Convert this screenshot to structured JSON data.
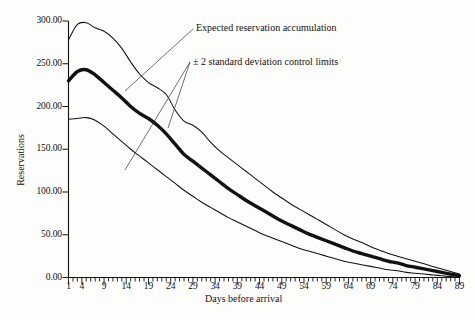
{
  "chart_data": {
    "type": "line",
    "title": "",
    "xlabel": "Days before arrival",
    "ylabel": "Reservations",
    "xlim": [
      1,
      89
    ],
    "ylim": [
      0,
      300
    ],
    "grid": false,
    "legend_position": "none",
    "x_tick_labels": [
      "1",
      "4",
      "9",
      "14",
      "19",
      "24",
      "29",
      "34",
      "39",
      "44",
      "49",
      "54",
      "59",
      "64",
      "69",
      "74",
      "79",
      "84",
      "89"
    ],
    "x_tick_values": [
      1,
      4,
      9,
      14,
      19,
      24,
      29,
      34,
      39,
      44,
      49,
      54,
      59,
      64,
      69,
      74,
      79,
      84,
      89
    ],
    "y_tick_labels": [
      "0.00",
      "50.00",
      "100.00",
      "150.00",
      "200.00",
      "250.00",
      "300.00"
    ],
    "y_tick_values": [
      0,
      50,
      100,
      150,
      200,
      250,
      300
    ],
    "x": [
      1,
      3,
      5,
      7,
      9,
      11,
      13,
      15,
      17,
      19,
      21,
      23,
      25,
      27,
      29,
      31,
      33,
      35,
      37,
      39,
      41,
      43,
      45,
      47,
      49,
      51,
      53,
      55,
      57,
      59,
      61,
      63,
      65,
      67,
      69,
      71,
      73,
      75,
      77,
      79,
      81,
      83,
      85,
      87,
      89
    ],
    "series": [
      {
        "name": "Upper control limit (+2 standard deviations)",
        "style": "thin",
        "values": [
          278,
          296,
          298,
          292,
          288,
          280,
          268,
          252,
          238,
          228,
          222,
          214,
          196,
          183,
          178,
          170,
          158,
          148,
          140,
          132,
          124,
          116,
          108,
          100,
          93,
          86,
          80,
          74,
          68,
          62,
          56,
          50,
          45,
          41,
          36,
          32,
          28,
          25,
          22,
          19,
          16,
          13,
          10,
          7,
          4
        ]
      },
      {
        "name": "Expected reservation accumulation",
        "style": "thick",
        "values": [
          230,
          241,
          243,
          237,
          228,
          219,
          210,
          200,
          192,
          186,
          178,
          168,
          156,
          144,
          136,
          128,
          120,
          112,
          104,
          97,
          90,
          84,
          78,
          72,
          66,
          61,
          56,
          51,
          47,
          43,
          39,
          35,
          31,
          28,
          25,
          22,
          19,
          17,
          14,
          12,
          10,
          8,
          6,
          4,
          2
        ]
      },
      {
        "name": "Lower control limit (-2 standard deviations)",
        "style": "thin",
        "values": [
          185,
          186,
          187,
          184,
          177,
          168,
          159,
          150,
          142,
          134,
          126,
          118,
          110,
          102,
          95,
          88,
          82,
          76,
          70,
          65,
          60,
          55,
          50,
          46,
          42,
          38,
          34,
          31,
          28,
          25,
          22,
          19,
          17,
          15,
          13,
          11,
          9,
          8,
          6,
          5,
          4,
          3,
          2,
          1,
          0
        ]
      }
    ],
    "annotations": [
      {
        "label": "Expected reservation accumulation",
        "target_x": 13,
        "target_y": 227
      },
      {
        "label": "± 2 standard deviation control limits",
        "target_x_a": 24,
        "target_y_a": 183,
        "target_x_b": 12,
        "target_y_b": 123
      }
    ]
  }
}
